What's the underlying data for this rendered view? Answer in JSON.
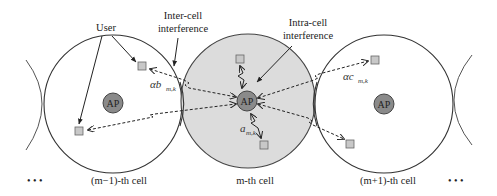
{
  "diagram": {
    "type": "multi-cell interference model",
    "colors": {
      "cell_outline": "#333333",
      "middle_cell_fill": "#dcdcdc",
      "ap_fill": "#8a8a8a",
      "user_fill": "#c8c8c8",
      "arrow": "#222222"
    },
    "annotations": {
      "user": "User",
      "inter_cell_line1": "Inter-cell",
      "inter_cell_line2": "interference",
      "intra_cell_line1": "Intra-cell",
      "intra_cell_line2": "interference"
    },
    "ap_label": "AP",
    "symbols": {
      "alpha_b": "αb",
      "alpha_b_sub": "m,k",
      "alpha_c": "αc",
      "alpha_c_sub": "m,k",
      "a": "a",
      "a_sub": "m,k"
    },
    "cells": [
      {
        "label": "(m−1)-th cell"
      },
      {
        "label": "m-th cell"
      },
      {
        "label": "(m+1)-th cell"
      }
    ],
    "ellipsis_left": "• • •",
    "ellipsis_right": "• • •"
  }
}
